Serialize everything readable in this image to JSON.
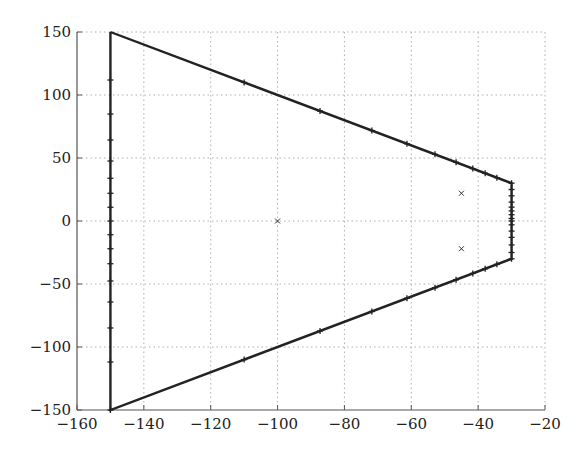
{
  "chart_data": {
    "type": "line",
    "title": "",
    "xlabel": "",
    "ylabel": "",
    "xlim": [
      -160,
      -20
    ],
    "ylim": [
      -150,
      150
    ],
    "grid": true,
    "grid_style": "dotted",
    "legend": null,
    "xticks": [
      -160,
      -140,
      -120,
      -100,
      -80,
      -60,
      -40,
      -20
    ],
    "yticks": [
      -150,
      -100,
      -50,
      0,
      50,
      100,
      150
    ],
    "xtick_labels": [
      "−160",
      "−140",
      "−120",
      "−100",
      "−80",
      "−60",
      "−40",
      "−20"
    ],
    "ytick_labels": [
      "−150",
      "−100",
      "−50",
      "0",
      "50",
      "100",
      "150"
    ],
    "series": [
      {
        "name": "boundary",
        "style": "solid-with-plus-markers",
        "color": "#222222",
        "x": [
          -150,
          -30,
          -30,
          -150,
          -150
        ],
        "y": [
          150,
          30,
          -30,
          -150,
          150
        ]
      },
      {
        "name": "boundary-markers-top-edge",
        "marker": "+",
        "x": [
          -110,
          -87.3,
          -71.8,
          -61.3,
          -52.9,
          -46.6,
          -41.6,
          -37.9,
          -34.4,
          -30
        ],
        "y": [
          110,
          87.3,
          71.8,
          61.3,
          52.9,
          46.6,
          41.6,
          37.9,
          34.4,
          30
        ]
      },
      {
        "name": "boundary-markers-bottom-edge",
        "marker": "+",
        "x": [
          -110,
          -87.3,
          -71.8,
          -61.3,
          -52.9,
          -46.6,
          -41.6,
          -37.9,
          -34.4,
          -30
        ],
        "y": [
          -110,
          -87.3,
          -71.8,
          -61.3,
          -52.9,
          -46.6,
          -41.6,
          -37.9,
          -34.4,
          -30
        ]
      },
      {
        "name": "boundary-markers-left-edge",
        "marker": "+",
        "x": [
          -150,
          -150,
          -150,
          -150,
          -150,
          -150,
          -150,
          -150,
          -150,
          -150,
          -150,
          -150,
          -150,
          -150,
          -150,
          -150
        ],
        "y": [
          111.9,
          84.9,
          64.3,
          47.6,
          33.9,
          22,
          10.9,
          0,
          -10.9,
          -22,
          -33.9,
          -47.6,
          -64.3,
          -84.9,
          -111.9,
          -150
        ]
      },
      {
        "name": "boundary-markers-right-edge",
        "marker": "+",
        "x": [
          -30,
          -30,
          -30,
          -30,
          -30,
          -30,
          -30,
          -30,
          -30,
          -30,
          -30,
          -30,
          -30
        ],
        "y": [
          25,
          20,
          15,
          11,
          8,
          5,
          2,
          0,
          -3,
          -8,
          -13,
          -19,
          -25
        ]
      },
      {
        "name": "poles",
        "marker": "x",
        "x": [
          -100,
          -45,
          -45
        ],
        "y": [
          0,
          22,
          -22
        ]
      }
    ]
  }
}
